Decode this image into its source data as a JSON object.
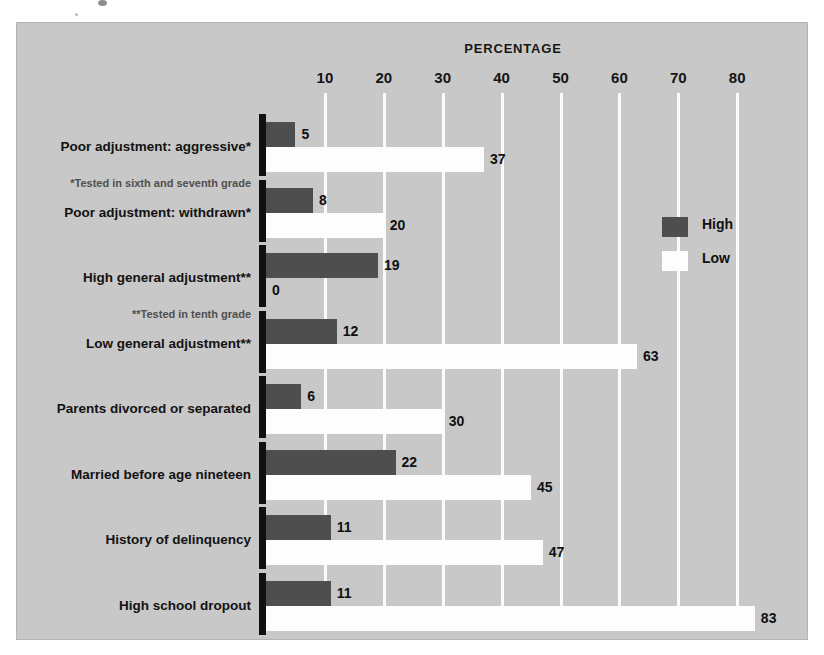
{
  "chart_data": {
    "type": "bar",
    "orientation": "horizontal",
    "title": "",
    "xlabel": "PERCENTAGE",
    "ylabel": "",
    "xlim": [
      0,
      88
    ],
    "ticks": [
      10,
      20,
      30,
      40,
      50,
      60,
      70,
      80
    ],
    "grid": true,
    "legend_position": "right",
    "categories": [
      "Poor adjustment: aggressive*",
      "Poor adjustment: withdrawn*",
      "High general adjustment**",
      "Low general adjustment**",
      "Parents divorced or separated",
      "Married before age nineteen",
      "History of delinquency",
      "High school dropout"
    ],
    "series": [
      {
        "name": "High",
        "color": "#4e4e4e",
        "values": [
          5,
          8,
          19,
          12,
          6,
          22,
          11,
          11
        ]
      },
      {
        "name": "Low",
        "color": "#fdfdfd",
        "values": [
          37,
          20,
          0,
          63,
          30,
          45,
          47,
          83
        ]
      }
    ],
    "annotations": [
      "*Tested in sixth and seventh grade",
      "**Tested in tenth grade"
    ]
  },
  "axis": {
    "title": "PERCENTAGE",
    "tick_labels": [
      "10",
      "20",
      "30",
      "40",
      "50",
      "60",
      "70",
      "80"
    ]
  },
  "legend": {
    "items": [
      {
        "label": "High",
        "swatch": "dark-swatch"
      },
      {
        "label": "Low",
        "swatch": "light-swatch"
      }
    ]
  },
  "footnotes": {
    "one": "*Tested in sixth and seventh grade",
    "two": "**Tested in tenth grade"
  },
  "colors": {
    "plate_background": "#c8c8c8",
    "high_bar": "#4e4e4e",
    "low_bar": "#fdfdfd",
    "gridline": "#fbfbfb",
    "axis_spine": "#111111",
    "text": "#121212"
  }
}
